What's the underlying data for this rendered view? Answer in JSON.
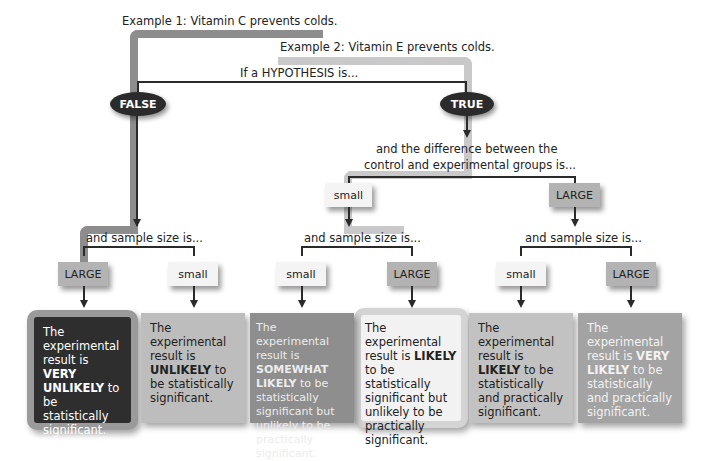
{
  "examples": {
    "example1": "Example 1: Vitamin C prevents colds.",
    "example2": "Example 2: Vitamin E prevents colds."
  },
  "root_label": "If a HYPOTHESIS is...",
  "hypothesis": {
    "false_label": "FALSE",
    "true_label": "TRUE"
  },
  "difference_label_line1": "and the difference between the",
  "difference_label_line2": "control and experimental groups is...",
  "difference_options": {
    "small": "small",
    "large": "LARGE"
  },
  "sample_size_label": "and sample size is...",
  "sample_tags": {
    "false_large": "LARGE",
    "false_small": "small",
    "small_small": "small",
    "small_large": "LARGE",
    "large_small": "small",
    "large_large": "LARGE"
  },
  "outcomes": [
    {
      "pre": "The experimental result is ",
      "bold": "VERY UNLIKELY",
      "post": " to be statistically significant.",
      "bg": "#2e2e2e",
      "fg": "#ffffff",
      "frame": "#9a9a9a"
    },
    {
      "pre": "The experimental result is ",
      "bold": "UNLIKELY",
      "post": " to be statistically significant.",
      "bg": "#bdbdbd",
      "fg": "#222222"
    },
    {
      "pre": "The experimental result is ",
      "bold": "SOMEWHAT LIKELY",
      "post": " to be statistically significant but unlikely to be practically significant.",
      "bg": "#8e8e8e",
      "fg": "#e8e8e8"
    },
    {
      "pre": "The experimental result is ",
      "bold": "LIKELY",
      "post": " to be statistically significant but unlikely to be practically significant.",
      "bg": "#f2f2f2",
      "fg": "#222222",
      "frame": "#cfcfcf"
    },
    {
      "pre": "The experimental result is ",
      "bold": "LIKELY",
      "post": " to be statistically and practically significant.",
      "bg": "#c2c2c2",
      "fg": "#222222"
    },
    {
      "pre": "The experimental result is ",
      "bold": "VERY LIKELY",
      "post": " to be statistically and practically significant.",
      "bg": "#a3a3a3",
      "fg": "#f2f2f2"
    }
  ],
  "colors": {
    "example1_path": "#8d8d8d",
    "example2_path": "#c9c9c9",
    "node_dark": "#2b2b2b"
  }
}
